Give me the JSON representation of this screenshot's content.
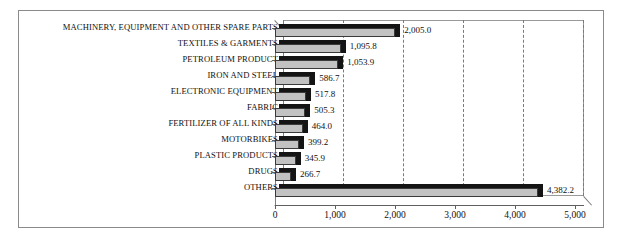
{
  "chart_data": {
    "type": "bar",
    "orientation": "horizontal",
    "title": "",
    "xlabel": "",
    "ylabel": "",
    "xlim": [
      0,
      5000
    ],
    "grid": true,
    "legend": "none",
    "xticks": [
      "0",
      "1,000",
      "2,000",
      "3,000",
      "4,000",
      "5,000"
    ],
    "xtick_values": [
      0,
      1000,
      2000,
      3000,
      4000,
      5000
    ],
    "categories": [
      "MACHINERY, EQUIPMENT AND OTHER SPARE PARTS",
      "TEXTILES & GARMENTS",
      "PETROLEUM PRODUCT",
      "IRON AND STEEL",
      "ELECTRONIC EQUIPMENT",
      "FABRIC",
      "FERTILIZER OF ALL KINDS",
      "MOTORBIKES",
      "PLASTIC PRODUCTS",
      "DRUGS",
      "OTHERS"
    ],
    "values": [
      2005.0,
      1095.8,
      1053.9,
      586.7,
      517.8,
      505.3,
      464.0,
      399.2,
      345.9,
      266.7,
      4382.2
    ],
    "data_labels": [
      "2,005.0",
      "1,095.8",
      "1,053.9",
      "586.7",
      "517.8",
      "505.3",
      "464.0",
      "399.2",
      "345.9",
      "266.7",
      "4,382.2"
    ],
    "colors": {
      "bar_face": "#c2c2c2",
      "bar_shadow": "#141414",
      "bar_outline": "#3a3a3a",
      "gridline": "#7a7a7a",
      "axis": "#5f5f5f",
      "frame": "#8a8a8a",
      "background": "#ffffff",
      "text": "#111111"
    }
  }
}
